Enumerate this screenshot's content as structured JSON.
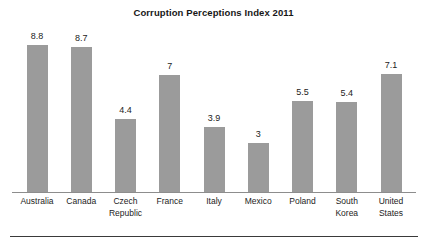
{
  "chart_data": {
    "type": "bar",
    "title": "Corruption Perceptions Index 2011",
    "xlabel": "",
    "ylabel": "",
    "ylim": [
      0,
      10
    ],
    "grid": false,
    "legend": "none",
    "orientation": "vertical",
    "bar_color": "#9b9b9b",
    "categories": [
      "Australia",
      "Canada",
      "Czech Republic",
      "France",
      "Italy",
      "Mexico",
      "Poland",
      "South Korea",
      "United States"
    ],
    "values": [
      8.8,
      8.7,
      4.4,
      7,
      3.9,
      3,
      5.5,
      5.4,
      7.1
    ],
    "value_labels": [
      "8.8",
      "8.7",
      "4.4",
      "7",
      "3.9",
      "3",
      "5.5",
      "5.4",
      "7.1"
    ],
    "category_lines": [
      [
        "Australia"
      ],
      [
        "Canada"
      ],
      [
        "Czech",
        "Republic"
      ],
      [
        "France"
      ],
      [
        "Italy"
      ],
      [
        "Mexico"
      ],
      [
        "Poland"
      ],
      [
        "South",
        "Korea"
      ],
      [
        "United",
        "States"
      ]
    ]
  }
}
